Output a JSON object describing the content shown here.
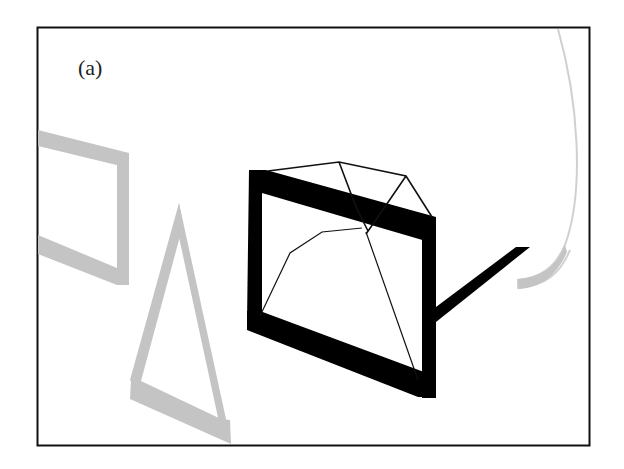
{
  "figure": {
    "panel_label": "(a)",
    "colors": {
      "background": "#ffffff",
      "border": "#111111",
      "black_shapes": "#000000",
      "gray_shapes": "#c4c4c4",
      "wire": "#111111"
    },
    "elements": [
      {
        "id": "gray-rectangle-frame",
        "description": "gray projected rectangular frame, partially cut off at left"
      },
      {
        "id": "gray-triangle-frame",
        "description": "gray projected triangular frame"
      },
      {
        "id": "black-rectangle-frame",
        "description": "thick black projected rectangular frame"
      },
      {
        "id": "wireframe-mesh",
        "description": "thin black wireframe polyhedron overlapping black frame"
      },
      {
        "id": "black-arm",
        "description": "thick black bar extending right from frame"
      },
      {
        "id": "gray-curved-arc",
        "description": "light gray curved arc at right edge"
      }
    ]
  }
}
